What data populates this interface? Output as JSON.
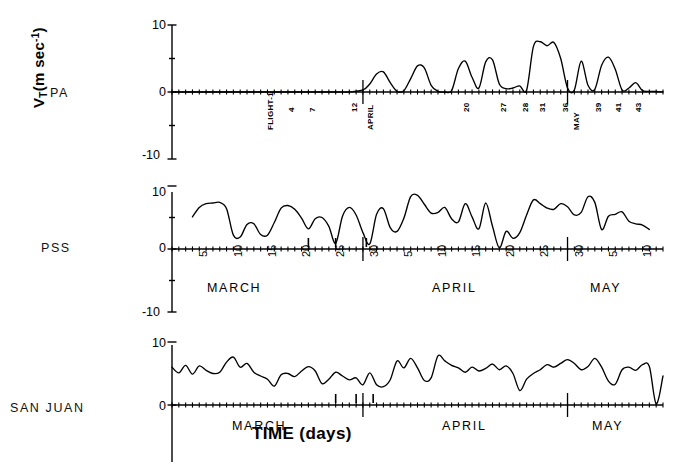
{
  "figure": {
    "ylabel_main": "V",
    "ylabel_sub": "T",
    "ylabel_rest": "(m sec",
    "ylabel_sup": "-1",
    "ylabel_close": ")",
    "xaxis_title": "TIME (days)",
    "line_color": "#000000",
    "axis_color": "#000000"
  },
  "panels": [
    {
      "id": "pa",
      "station": "PA",
      "yticks": [
        "10",
        "0",
        "-10"
      ],
      "ytick_values": [
        10,
        0,
        -10
      ],
      "ylim": [
        -10,
        10
      ],
      "month_labels": [],
      "day_labels": [],
      "flight_labels": [
        "FLIGHT-1",
        "4",
        "7",
        "12",
        "APRIL",
        "20",
        "27",
        "28",
        "31",
        "36",
        "MAY",
        "39",
        "41",
        "43"
      ]
    },
    {
      "id": "pss",
      "station": "PSS",
      "yticks": [
        "10",
        "0",
        "-10"
      ],
      "ytick_values": [
        10,
        0,
        -10
      ],
      "ylim": [
        -10,
        10
      ],
      "month_labels": [
        "MARCH",
        "APRIL",
        "MAY"
      ],
      "day_labels": [
        "5",
        "10",
        "15",
        "20",
        "25",
        "30",
        "5",
        "10",
        "15",
        "20",
        "25",
        "30",
        "5",
        "10",
        "15"
      ],
      "flight_labels": []
    },
    {
      "id": "sanjuan",
      "station": "SAN JUAN",
      "yticks": [
        "10",
        "0"
      ],
      "ytick_values": [
        10,
        0
      ],
      "ylim": [
        -10,
        10
      ],
      "month_labels": [
        "MARCH",
        "APRIL",
        "MAY"
      ],
      "day_labels": [],
      "flight_labels": []
    }
  ],
  "chart_data": {
    "type": "line",
    "title": "",
    "subtitle": "",
    "xlabel": "TIME (days)",
    "ylabel": "V_T (m sec^-1)",
    "grid": false,
    "legend": "none",
    "x_axis": {
      "description": "Day of year from 5 March through 15 May; tick every day, labelled every 5 days",
      "tick_labels": [
        "5",
        "10",
        "15",
        "20",
        "25",
        "30",
        "5",
        "10",
        "15",
        "20",
        "25",
        "30",
        "5",
        "10",
        "15"
      ],
      "month_spans": [
        "MARCH",
        "APRIL",
        "MAY"
      ],
      "range_days": [
        2,
        74
      ]
    },
    "y_axis": {
      "tick_labels": [
        "10",
        "5",
        "0",
        "-5",
        "-10"
      ],
      "tick_values": [
        10,
        5,
        0,
        -5,
        -10
      ],
      "ylim": [
        -10,
        10
      ],
      "units": "m sec^-1"
    },
    "series": [
      {
        "name": "PA",
        "panel": "pa",
        "note": "Zero / no data before ~1 April, then intermittent bursts",
        "x": [
          2,
          4,
          6,
          8,
          10,
          12,
          14,
          16,
          18,
          20,
          22,
          24,
          26,
          28,
          30,
          31,
          32,
          33,
          34,
          35,
          36,
          37,
          38,
          39,
          40,
          41,
          42,
          43,
          44,
          45,
          46,
          47,
          48,
          49,
          50,
          51,
          52,
          53,
          54,
          55,
          56,
          57,
          58,
          59,
          60,
          61,
          62,
          63,
          64,
          65,
          66,
          67,
          68,
          69,
          70,
          71,
          72,
          73,
          74
        ],
        "values": [
          0,
          0,
          0,
          0,
          0,
          0,
          0,
          0,
          0,
          0,
          0,
          0,
          0,
          0,
          0.3,
          1.2,
          2.7,
          3.0,
          1.4,
          0.1,
          0.2,
          2.0,
          3.9,
          3.6,
          1.0,
          0.1,
          0.0,
          0.2,
          3.5,
          4.6,
          2.2,
          0.6,
          4.5,
          4.8,
          1.2,
          0.5,
          0.6,
          0.9,
          0.3,
          6.8,
          7.5,
          6.9,
          7.4,
          5.0,
          0.6,
          0.3,
          4.6,
          1.0,
          0.4,
          4.0,
          5.2,
          3.4,
          0.3,
          0.6,
          1.4,
          0.2,
          0.1,
          0.1,
          0.0
        ]
      },
      {
        "name": "PSS",
        "panel": "pss",
        "note": "Continuous record from 5 March to ~12 May",
        "x": [
          5,
          6,
          7,
          8,
          9,
          10,
          11,
          12,
          13,
          14,
          15,
          16,
          17,
          18,
          19,
          20,
          21,
          22,
          23,
          24,
          25,
          26,
          27,
          28,
          29,
          30,
          31,
          32,
          33,
          34,
          35,
          36,
          37,
          38,
          39,
          40,
          41,
          42,
          43,
          44,
          45,
          46,
          47,
          48,
          49,
          50,
          51,
          52,
          53,
          54,
          55,
          56,
          57,
          58,
          59,
          60,
          61,
          62,
          63,
          64,
          65,
          66,
          67,
          68,
          69,
          70,
          71,
          72
        ],
        "values": [
          5.1,
          6.6,
          7.2,
          7.3,
          7.4,
          6.4,
          2.2,
          1.9,
          3.9,
          4.0,
          2.3,
          2.2,
          4.2,
          6.5,
          6.9,
          6.3,
          4.9,
          3.2,
          4.8,
          5.0,
          3.6,
          0.9,
          5.2,
          6.6,
          5.4,
          2.6,
          0.8,
          5.5,
          6.4,
          3.4,
          2.8,
          4.9,
          8.3,
          8.5,
          7.1,
          5.7,
          5.8,
          6.6,
          4.8,
          4.3,
          7.2,
          5.1,
          3.2,
          7.3,
          3.6,
          0.2,
          2.8,
          1.7,
          2.6,
          5.4,
          7.8,
          7.2,
          6.5,
          6.3,
          7.2,
          6.7,
          5.4,
          5.8,
          8.3,
          7.4,
          3.1,
          5.2,
          5.5,
          5.9,
          4.4,
          4.0,
          3.8,
          3.1
        ]
      },
      {
        "name": "SAN JUAN",
        "panel": "sanjuan",
        "note": "Continuous record; high-frequency variability, deep minimum in early May",
        "x": [
          2,
          3,
          4,
          5,
          6,
          7,
          8,
          9,
          10,
          11,
          12,
          13,
          14,
          15,
          16,
          17,
          18,
          19,
          20,
          21,
          22,
          23,
          24,
          25,
          26,
          27,
          28,
          29,
          30,
          31,
          32,
          33,
          34,
          35,
          36,
          37,
          38,
          39,
          40,
          41,
          42,
          43,
          44,
          45,
          46,
          47,
          48,
          49,
          50,
          51,
          52,
          53,
          54,
          55,
          56,
          57,
          58,
          59,
          60,
          61,
          62,
          63,
          64,
          65,
          66,
          67,
          68,
          69,
          70,
          71,
          72,
          73,
          74
        ],
        "values": [
          6.0,
          5.1,
          6.3,
          4.9,
          6.2,
          5.5,
          5.0,
          5.2,
          6.8,
          7.6,
          6.0,
          6.6,
          5.2,
          4.6,
          4.1,
          3.0,
          4.8,
          5.0,
          4.5,
          5.4,
          6.1,
          5.4,
          3.4,
          4.1,
          5.2,
          4.6,
          4.0,
          4.3,
          3.2,
          5.1,
          3.2,
          2.9,
          4.0,
          7.0,
          5.9,
          7.4,
          5.9,
          3.9,
          4.3,
          7.8,
          7.0,
          6.3,
          5.9,
          5.2,
          6.0,
          5.4,
          5.8,
          6.5,
          5.6,
          6.2,
          5.0,
          2.3,
          4.1,
          5.0,
          5.6,
          6.4,
          6.0,
          6.6,
          7.2,
          6.6,
          5.6,
          6.1,
          7.4,
          6.0,
          3.8,
          3.3,
          5.6,
          6.0,
          5.5,
          6.4,
          6.1,
          0.2,
          4.6
        ]
      }
    ]
  }
}
